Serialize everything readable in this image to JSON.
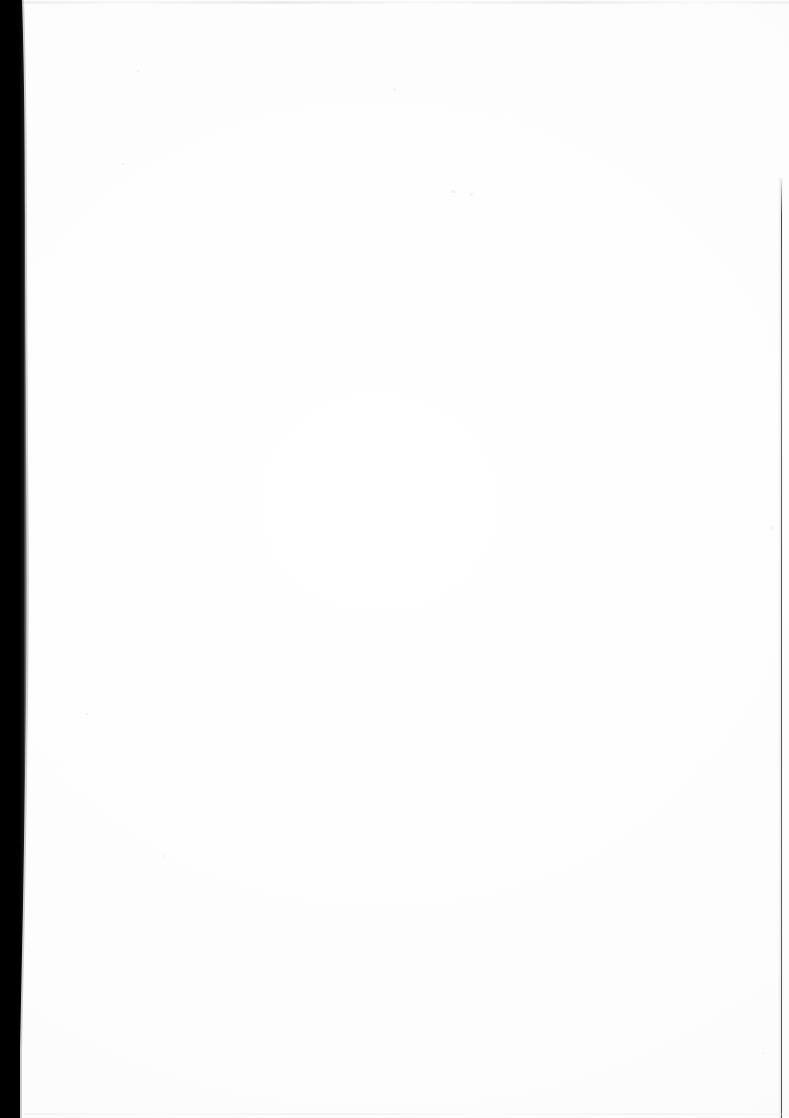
{
  "document": {
    "kind": "scanned-page",
    "title": "Scanned blank page",
    "page_content": "",
    "page_status": "blank",
    "text_blocks": [],
    "headings": [],
    "page_number": "",
    "colors": {
      "paper": "#fefefe",
      "gutter_shadow": "#000000",
      "edge_rule": "#2e2e33",
      "scan_line": "#e6e6ea"
    }
  },
  "artifacts": {
    "left_gutter_shadow": {
      "name": "left-gutter-shadow",
      "description": "black book spine shadow along left edge",
      "width_top_px": 22,
      "width_mid_px": 26,
      "width_bottom_px": 20
    },
    "right_edge_rule": {
      "name": "right-edge-rule",
      "description": "thin dark vertical line near right edge",
      "x_px": 782,
      "y_start_px": 178,
      "y_end_px": 1118
    },
    "top_scan_line": {
      "name": "top-scan-line",
      "description": "faint grey horizontal line at top of scan"
    },
    "bottom_scan_line": {
      "name": "bottom-scan-line",
      "description": "faint grey horizontal line at bottom of scan"
    },
    "specks": [
      {
        "x": 393,
        "y": 88,
        "w": 3,
        "h": 3
      },
      {
        "x": 451,
        "y": 190,
        "w": 4,
        "h": 3
      },
      {
        "x": 470,
        "y": 193,
        "w": 3,
        "h": 3
      },
      {
        "x": 137,
        "y": 70,
        "w": 2,
        "h": 2
      },
      {
        "x": 122,
        "y": 163,
        "w": 2,
        "h": 2
      },
      {
        "x": 455,
        "y": 191,
        "w": 2,
        "h": 2
      },
      {
        "x": 86,
        "y": 713,
        "w": 2,
        "h": 2
      },
      {
        "x": 163,
        "y": 855,
        "w": 2,
        "h": 2
      },
      {
        "x": 771,
        "y": 527,
        "w": 3,
        "h": 2
      },
      {
        "x": 762,
        "y": 1052,
        "w": 2,
        "h": 2
      }
    ]
  }
}
